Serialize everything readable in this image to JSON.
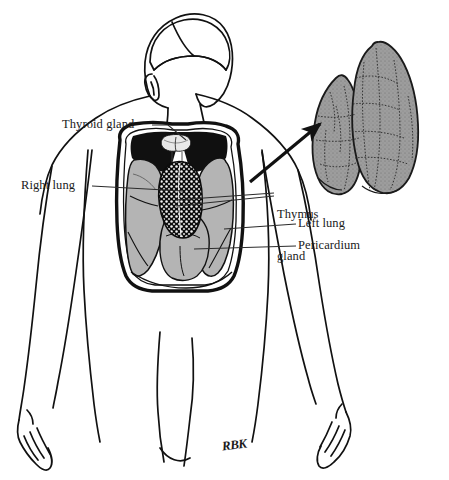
{
  "figure": {
    "width": 449,
    "height": 480,
    "background_color": "#ffffff",
    "signature": "RBK"
  },
  "labels": [
    {
      "id": "thyroid-gland",
      "text": "Thyroid gland",
      "lines": [
        "Thyroid gland"
      ],
      "x": 62,
      "y": 118,
      "align": "left",
      "leader": {
        "from": [
          152,
          125
        ],
        "to": [
          183,
          140
        ]
      }
    },
    {
      "id": "right-lung",
      "text": "Right lung",
      "lines": [
        "Right lung"
      ],
      "x": 21,
      "y": 179,
      "align": "left",
      "leader": {
        "from": [
          92,
          186
        ],
        "to": [
          181,
          191
        ]
      }
    },
    {
      "id": "thymus-gland",
      "text": "Thymus gland",
      "lines": [
        "Thymus",
        "gland"
      ],
      "x": 277,
      "y": 179,
      "align": "left",
      "leader": {
        "from": [
          274,
          193
        ],
        "to": [
          176,
          200
        ]
      }
    },
    {
      "id": "left-lung",
      "text": "Left lung",
      "lines": [
        "Left lung"
      ],
      "x": 298,
      "y": 217,
      "align": "left",
      "leader": {
        "from": [
          296,
          224
        ],
        "to": [
          224,
          229
        ]
      }
    },
    {
      "id": "pericardium",
      "text": "Pericardium",
      "lines": [
        "Pericardium"
      ],
      "x": 298,
      "y": 239,
      "align": "left",
      "leader": {
        "from": [
          296,
          246
        ],
        "to": [
          196,
          249
        ]
      }
    }
  ],
  "colors": {
    "ink": "#111111",
    "lung_fill": "#b4b4b4",
    "organ_dark": "#101010",
    "inset_fill": "#9a9a9a",
    "inset_line": "#1a1a1a",
    "paper": "#ffffff"
  },
  "anatomy": {
    "figure_view": "anterior torso of a human, head turned, arms at sides",
    "structures": [
      {
        "name": "head",
        "shading": "outline"
      },
      {
        "name": "neck",
        "shading": "dark"
      },
      {
        "name": "thyroid gland",
        "shading": "dark"
      },
      {
        "name": "thymus gland",
        "shading": "dark lobulated"
      },
      {
        "name": "right lung",
        "shading": "gray"
      },
      {
        "name": "left lung",
        "shading": "gray"
      },
      {
        "name": "pericardium",
        "shading": "gray"
      },
      {
        "name": "rib cage outline",
        "shading": "outline"
      },
      {
        "name": "arms",
        "shading": "outline"
      },
      {
        "name": "hands",
        "shading": "outline"
      }
    ]
  },
  "inset": {
    "id": "thymus-detail",
    "caption": "",
    "description": "enlarged two-lobed thymus gland with lobulated surface",
    "lobes": 2,
    "arrow": {
      "from": [
        253,
        180
      ],
      "to": [
        323,
        122
      ],
      "style": "solid filled arrowhead"
    }
  }
}
